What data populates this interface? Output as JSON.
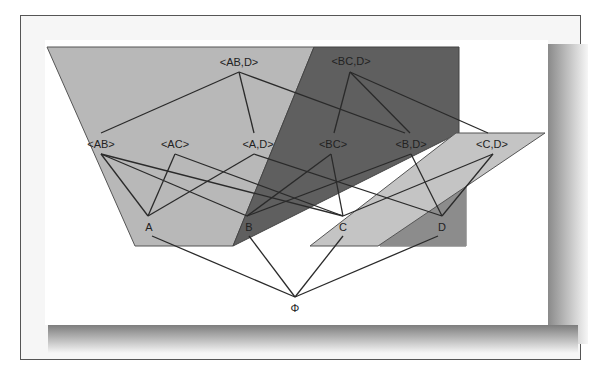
{
  "diagram": {
    "type": "lattice",
    "colors": {
      "region_light": "#b8b8b8",
      "region_dark": "#5f5f5f",
      "region_strip": "#c4c4c4",
      "region_medium": "#8c8c8c",
      "edge": "#2a2a2a",
      "frame": "#555555"
    },
    "nodes": {
      "ab_d": "<AB,D>",
      "bc_d": "<BC,D>",
      "ab": "<AB>",
      "ac": "<AC>",
      "a_d": "<A,D>",
      "bc": "<BC>",
      "b_d": "<B,D>",
      "c_d": "<C,D>",
      "a": "A",
      "b": "B",
      "c": "C",
      "d": "D",
      "phi": "Φ"
    },
    "edges": [
      [
        "<AB,D>",
        "<AB>"
      ],
      [
        "<AB,D>",
        "<A,D>"
      ],
      [
        "<AB,D>",
        "<B,D>"
      ],
      [
        "<BC,D>",
        "<BC>"
      ],
      [
        "<BC,D>",
        "<B,D>"
      ],
      [
        "<BC,D>",
        "<C,D>"
      ],
      [
        "<AB>",
        "A"
      ],
      [
        "<AB>",
        "B"
      ],
      [
        "<AB>",
        "C"
      ],
      [
        "<AC>",
        "A"
      ],
      [
        "<AC>",
        "C"
      ],
      [
        "<A,D>",
        "A"
      ],
      [
        "<A,D>",
        "D"
      ],
      [
        "<BC>",
        "B"
      ],
      [
        "<BC>",
        "C"
      ],
      [
        "<B,D>",
        "B"
      ],
      [
        "<B,D>",
        "D"
      ],
      [
        "<C,D>",
        "C"
      ],
      [
        "<C,D>",
        "D"
      ],
      [
        "A",
        "Φ"
      ],
      [
        "B",
        "Φ"
      ],
      [
        "C",
        "Φ"
      ],
      [
        "D",
        "Φ"
      ]
    ]
  }
}
